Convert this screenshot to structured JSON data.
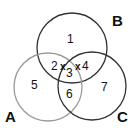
{
  "diagram": {
    "type": "venn",
    "sets": [
      {
        "name": "A",
        "label": "A",
        "stroke": "#9a9a9a"
      },
      {
        "name": "B",
        "label": "B",
        "stroke": "#333333"
      },
      {
        "name": "C",
        "label": "C",
        "stroke": "#333333"
      }
    ],
    "regions": [
      {
        "id": "1",
        "label": "1",
        "sets": [
          "B"
        ]
      },
      {
        "id": "2",
        "label": "2",
        "sets": [
          "A",
          "B"
        ]
      },
      {
        "id": "3",
        "label": "3",
        "sets": [
          "A",
          "B",
          "C"
        ]
      },
      {
        "id": "4",
        "label": "4",
        "sets": [
          "B",
          "C"
        ]
      },
      {
        "id": "5",
        "label": "5",
        "sets": [
          "A"
        ]
      },
      {
        "id": "6",
        "label": "6",
        "sets": [
          "A",
          "C"
        ]
      },
      {
        "id": "7",
        "label": "7",
        "sets": [
          "C"
        ]
      }
    ],
    "markers": [
      {
        "label": "x"
      },
      {
        "label": "x"
      }
    ]
  }
}
